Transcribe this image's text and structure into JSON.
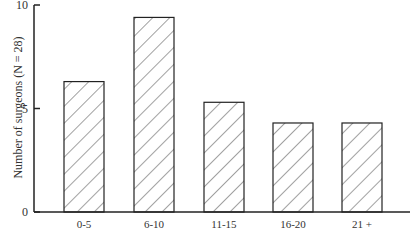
{
  "chart_data": {
    "type": "bar",
    "title": "",
    "xlabel": "",
    "ylabel": "Number of surgeons (N = 28)",
    "categories": [
      "0-5",
      "6-10",
      "11-15",
      "16-20",
      "21 +"
    ],
    "values": [
      6.3,
      9.4,
      5.3,
      4.3,
      4.3
    ],
    "ylim": [
      0,
      10
    ],
    "yticks": [
      0,
      5,
      10
    ],
    "grid": false,
    "legend": null,
    "bar_style": "diagonal hatch"
  }
}
